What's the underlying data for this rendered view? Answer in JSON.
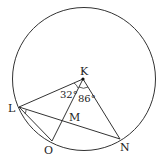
{
  "diagram": {
    "type": "circle-geometry",
    "circle": {
      "center_label": "K"
    },
    "points": {
      "K": "K",
      "L": "L",
      "M": "M",
      "N": "N",
      "O": "O"
    },
    "angles": {
      "LKO": "32°",
      "OKN": "86°"
    },
    "segments": [
      "KL",
      "KO",
      "KN",
      "LN",
      "LO"
    ],
    "colors": {
      "stroke": "#333333",
      "background": "#ffffff"
    }
  }
}
